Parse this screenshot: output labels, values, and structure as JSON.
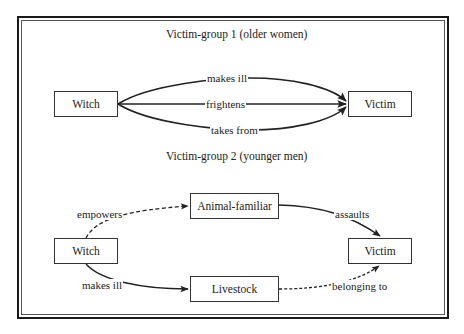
{
  "group1": {
    "title": "Victim-group 1 (older women)",
    "nodes": {
      "witch": "Witch",
      "victim": "Victim"
    },
    "edges": [
      {
        "from": "Witch",
        "to": "Victim",
        "label": "makes ill",
        "style": "solid"
      },
      {
        "from": "Witch",
        "to": "Victim",
        "label": "frightens",
        "style": "solid"
      },
      {
        "from": "Witch",
        "to": "Victim",
        "label": "takes from",
        "style": "solid"
      }
    ]
  },
  "group2": {
    "title": "Victim-group 2 (younger men)",
    "nodes": {
      "witch": "Witch",
      "animal": "Animal-familiar",
      "livestock": "Livestock",
      "victim": "Victim"
    },
    "edges": [
      {
        "from": "Witch",
        "to": "Animal-familiar",
        "label": "empowers",
        "style": "dashed"
      },
      {
        "from": "Animal-familiar",
        "to": "Victim",
        "label": "assaults",
        "style": "solid"
      },
      {
        "from": "Witch",
        "to": "Livestock",
        "label": "makes ill",
        "style": "solid"
      },
      {
        "from": "Livestock",
        "to": "Victim",
        "label": "belonging to",
        "style": "dashed"
      }
    ]
  },
  "colors": {
    "line": "#222222",
    "background": "#ffffff"
  }
}
